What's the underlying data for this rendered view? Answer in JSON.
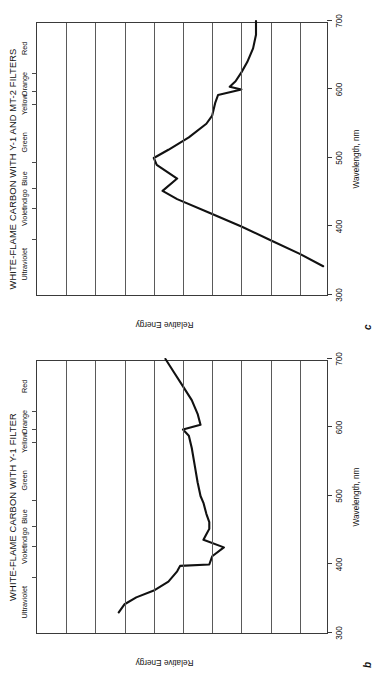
{
  "figure": {
    "orientation": "rotated-90-ccw",
    "background": "#ffffff",
    "ink": "#111111"
  },
  "axis_common": {
    "x_title": "Wavelength, nm",
    "y_title": "Relative Energy",
    "x_ticks": [
      300,
      400,
      500,
      600,
      700
    ],
    "x_tick_labels": [
      "300",
      "400",
      "500",
      "600",
      "700"
    ],
    "xlim": [
      300,
      700
    ],
    "ylim": [
      0,
      100
    ],
    "grid": "horizontal",
    "gridline_count": 9,
    "color_bands": [
      {
        "label": "Ultraviolet",
        "center_nm": 345
      },
      {
        "label": "Violet",
        "center_nm": 414
      },
      {
        "label": "Indigo",
        "center_nm": 440
      },
      {
        "label": "Blue",
        "center_nm": 470
      },
      {
        "label": "Green",
        "center_nm": 523
      },
      {
        "label": "Yellow",
        "center_nm": 578
      },
      {
        "label": "Orange",
        "center_nm": 608
      },
      {
        "label": "Red",
        "center_nm": 660
      }
    ],
    "band_tick_positions_nm": [
      380,
      425,
      455,
      492,
      577,
      597,
      622
    ]
  },
  "panels": [
    {
      "letter": "c",
      "title": "WHITE-FLAME CARBON WITH Y-1 AND MT-2 FILTERS"
    },
    {
      "letter": "b",
      "title": "WHITE-FLAME CARBON WITH Y-1 FILTER"
    }
  ],
  "chart_data": [
    {
      "id": "panel-c",
      "type": "line",
      "title": "WHITE-FLAME CARBON WITH Y-1 AND MT-2 FILTERS",
      "xlabel": "Wavelength, nm",
      "ylabel": "Relative Energy",
      "xlim": [
        300,
        700
      ],
      "ylim": [
        0,
        100
      ],
      "grid": true,
      "legend": null,
      "series": [
        {
          "name": "spectral distribution",
          "x": [
            342,
            360,
            380,
            400,
            420,
            440,
            452,
            470,
            490,
            500,
            512,
            530,
            550,
            562,
            580,
            592,
            600,
            604,
            612,
            625,
            640,
            660,
            680,
            700
          ],
          "values": [
            2,
            10,
            20,
            30,
            41,
            52,
            57,
            52,
            59,
            60,
            55,
            48,
            42,
            40,
            39,
            38,
            30,
            34,
            32,
            30,
            28,
            26,
            25,
            25
          ]
        }
      ]
    },
    {
      "id": "panel-b",
      "type": "line",
      "title": "WHITE-FLAME CARBON WITH Y-1 FILTER",
      "xlabel": "Wavelength, nm",
      "ylabel": "Relative Energy",
      "xlim": [
        300,
        700
      ],
      "ylim": [
        0,
        100
      ],
      "grid": true,
      "legend": null,
      "series": [
        {
          "name": "spectral distribution",
          "x": [
            330,
            342,
            352,
            362,
            375,
            390,
            398,
            400,
            412,
            425,
            436,
            444,
            452,
            462,
            474,
            490,
            500,
            520,
            545,
            570,
            588,
            597,
            604,
            620,
            640,
            660,
            680,
            700
          ],
          "values": [
            72,
            70,
            66,
            60,
            55,
            52,
            51,
            41,
            40,
            36,
            43,
            42,
            41,
            41,
            42,
            43,
            44,
            45,
            46,
            47,
            48,
            50,
            44,
            45,
            47,
            50,
            53,
            56
          ]
        }
      ]
    }
  ]
}
